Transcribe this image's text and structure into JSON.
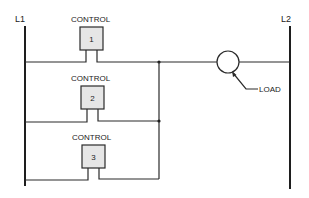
{
  "diagram": {
    "type": "ladder-logic",
    "rails": {
      "left_label": "L1",
      "right_label": "L2"
    },
    "controls": [
      {
        "label": "CONTROL",
        "number": "1"
      },
      {
        "label": "CONTROL",
        "number": "2"
      },
      {
        "label": "CONTROL",
        "number": "3"
      }
    ],
    "load": {
      "label": "LOAD"
    },
    "colors": {
      "line": "#2a2a2a",
      "box_fill": "#e6e6e6",
      "background": "#ffffff"
    }
  }
}
